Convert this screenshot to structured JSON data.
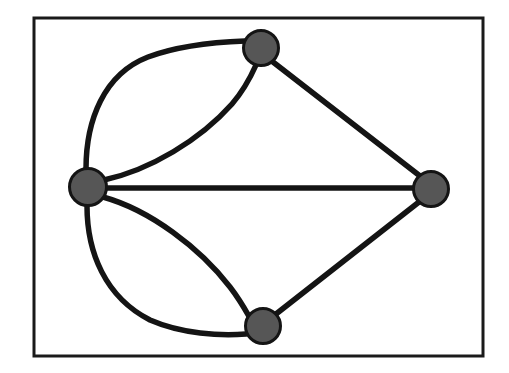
{
  "figure": {
    "title": "",
    "kind": "multigraph-node-link-diagram",
    "background_color": "#ffffff"
  },
  "frame": {
    "name": "figure-border",
    "x": 34,
    "y": 18,
    "width": 449,
    "height": 338,
    "stroke_color": "#1a1a1a",
    "stroke_width": 3,
    "fill_color": "#ffffff"
  },
  "style": {
    "node_fill_color": "#565656",
    "node_stroke_color": "#141414",
    "node_stroke_width": 3,
    "edge_stroke_color": "#141414",
    "edge_stroke_width": 5.5
  },
  "chart_data": {
    "type": "graph",
    "title": "",
    "xlabel": "",
    "ylabel": "",
    "node_count": 4,
    "edge_count": 7,
    "nodes": [
      {
        "id": "left",
        "label": "",
        "x": 88,
        "y": 187,
        "r": 18.5,
        "degree": 5
      },
      {
        "id": "top",
        "label": "",
        "x": 261,
        "y": 48,
        "r": 17.5,
        "degree": 3
      },
      {
        "id": "right",
        "label": "",
        "x": 431,
        "y": 189,
        "r": 17.5,
        "degree": 3
      },
      {
        "id": "bottom",
        "label": "",
        "x": 263,
        "y": 326,
        "r": 17.5,
        "degree": 3
      }
    ],
    "edges": [
      {
        "id": "left-top-outer",
        "source": "left",
        "target": "top",
        "shape": "curved",
        "path": "M 86 169 C 86 120 104 74 148 57 C 180 45 218 42 245 41"
      },
      {
        "id": "left-top-inner",
        "source": "left",
        "target": "top",
        "shape": "curved",
        "path": "M 104 180 C 150 170 200 140 232 104 C 244 90 252 74 256 65"
      },
      {
        "id": "left-right",
        "source": "left",
        "target": "right",
        "shape": "straight",
        "path": "M 106 188 L 414 188"
      },
      {
        "id": "top-right",
        "source": "top",
        "target": "right",
        "shape": "straight",
        "path": "M 273 62 L 420 176"
      },
      {
        "id": "left-bottom-inner",
        "source": "left",
        "target": "bottom",
        "shape": "curved",
        "path": "M 103 197 C 150 210 200 248 230 287 C 240 300 246 311 250 318"
      },
      {
        "id": "left-bottom-outer",
        "source": "left",
        "target": "bottom",
        "shape": "curved",
        "path": "M 87 206 C 87 252 105 297 150 320 C 182 334 220 336 246 334"
      },
      {
        "id": "bottom-right",
        "source": "bottom",
        "target": "right",
        "shape": "straight",
        "path": "M 276 314 L 419 202"
      }
    ],
    "parallel_edge_pairs": [
      {
        "between": [
          "left",
          "top"
        ],
        "count": 2
      },
      {
        "between": [
          "left",
          "bottom"
        ],
        "count": 2
      }
    ],
    "legend": [],
    "annotations": []
  }
}
